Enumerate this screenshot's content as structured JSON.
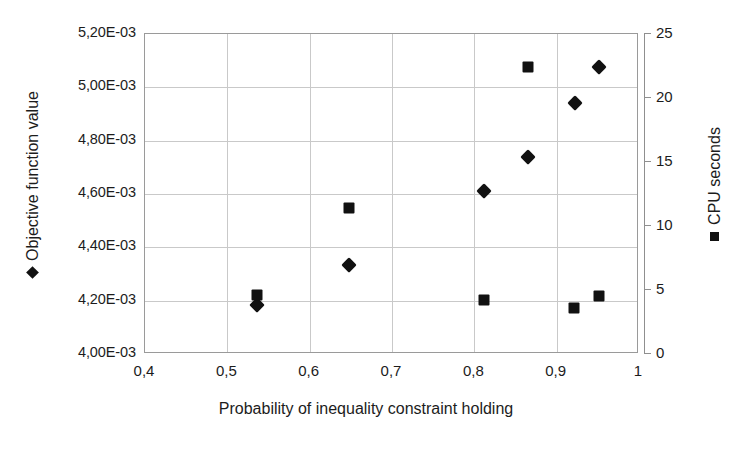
{
  "chart_data": {
    "type": "scatter",
    "title": "",
    "xlabel": "Probability of inequality constraint holding",
    "ylabel": "Objective function value",
    "ylabel_right": "CPU seconds",
    "xlim": [
      0.4,
      1.0
    ],
    "ylim": [
      0.004,
      0.0052
    ],
    "ylim_right": [
      0,
      25
    ],
    "grid": true,
    "legend_position": "axis-titles",
    "xticks": [
      "0,4",
      "0,5",
      "0,6",
      "0,7",
      "0,8",
      "0,9",
      "1"
    ],
    "xtick_values": [
      0.4,
      0.5,
      0.6,
      0.7,
      0.8,
      0.9,
      1.0
    ],
    "yticks_left": [
      "4,00E-03",
      "4,20E-03",
      "4,40E-03",
      "4,60E-03",
      "4,80E-03",
      "5,00E-03",
      "5,20E-03"
    ],
    "ytick_values_left": [
      0.004,
      0.0042,
      0.0044,
      0.0046,
      0.0048,
      0.005,
      0.0052
    ],
    "yticks_right": [
      "0",
      "5",
      "10",
      "15",
      "20",
      "25"
    ],
    "ytick_values_right": [
      0,
      5,
      10,
      15,
      20,
      25
    ],
    "series": [
      {
        "name": "Objective function value",
        "marker": "diamond",
        "color": "#111111",
        "axis": "left",
        "x": [
          0.536,
          0.648,
          0.812,
          0.865,
          0.922,
          0.952
        ],
        "y": [
          0.004185,
          0.004332,
          0.004612,
          0.004738,
          0.004943,
          0.005075
        ]
      },
      {
        "name": "CPU seconds",
        "marker": "square",
        "color": "#111111",
        "axis": "right",
        "x": [
          0.536,
          0.648,
          0.812,
          0.865,
          0.921,
          0.952
        ],
        "y": [
          4.6,
          11.4,
          4.2,
          22.4,
          3.6,
          4.5
        ]
      }
    ]
  },
  "legend": {
    "left_series_label": "Objective function value",
    "right_series_label": "CPU seconds"
  }
}
